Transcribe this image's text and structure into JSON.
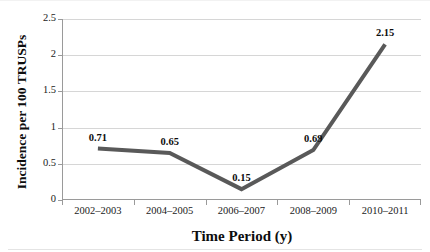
{
  "chart_data": {
    "type": "line",
    "title": "",
    "xlabel": "Time Period (y)",
    "ylabel": "Incidence per 100 TRUSPs",
    "categories": [
      "2002–2003",
      "2004–2005",
      "2006–2007",
      "2008–2009",
      "2010–2011"
    ],
    "values": [
      0.71,
      0.65,
      0.15,
      0.69,
      2.15
    ],
    "point_labels": [
      "0.71",
      "0.65",
      "0.15",
      "0.69",
      "2.15"
    ],
    "ylim": [
      0,
      2.5
    ],
    "yticks": [
      0,
      0.5,
      1,
      1.5,
      2,
      2.5
    ],
    "ytick_labels": [
      "0",
      "0.5",
      "1",
      "1.5",
      "2",
      "2.5"
    ],
    "grid": "horizontal",
    "legend": "none",
    "series": [
      {
        "name": "Incidence",
        "values": [
          0.71,
          0.65,
          0.15,
          0.69,
          2.15
        ],
        "color": "#595959",
        "line_width": 4,
        "markers": "none"
      }
    ],
    "colors": {
      "line": "#595959",
      "gridline": "#d6d6d6",
      "axis": "#9a9a9a",
      "text": "#0d0d0d",
      "background": "#ffffff"
    }
  }
}
